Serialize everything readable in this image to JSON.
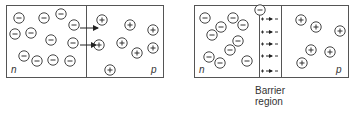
{
  "diagrams": [
    {
      "name": "before-junction",
      "frame": {
        "x": 6,
        "y": 5,
        "w": 157,
        "h": 72
      },
      "divider_x": 86,
      "n_label": "n",
      "p_label": "p",
      "electrons": [
        [
          19,
          18
        ],
        [
          44,
          18
        ],
        [
          61,
          14
        ],
        [
          74,
          25
        ],
        [
          15,
          34
        ],
        [
          31,
          33
        ],
        [
          51,
          40
        ],
        [
          73,
          43
        ],
        [
          24,
          56
        ],
        [
          37,
          61
        ],
        [
          53,
          60
        ],
        [
          70,
          61
        ]
      ],
      "holes": [
        [
          102,
          20
        ],
        [
          130,
          25
        ],
        [
          153,
          30
        ],
        [
          99,
          45
        ],
        [
          122,
          43
        ],
        [
          137,
          53
        ],
        [
          153,
          48
        ],
        [
          110,
          70
        ]
      ],
      "arrows": [
        [
          80,
          28,
          98,
          28
        ],
        [
          80,
          45,
          96,
          45
        ]
      ]
    },
    {
      "name": "after-junction",
      "frame": {
        "x": 194,
        "y": 5,
        "w": 154,
        "h": 72
      },
      "barrier": {
        "x1": 259,
        "x2": 281
      },
      "n_label": "n",
      "p_label": "p",
      "electrons": [
        [
          205,
          18
        ],
        [
          221,
          27
        ],
        [
          233,
          18
        ],
        [
          243,
          25
        ],
        [
          212,
          35
        ],
        [
          238,
          41
        ],
        [
          209,
          57
        ],
        [
          220,
          63
        ],
        [
          230,
          50
        ],
        [
          247,
          61
        ],
        [
          260,
          10
        ]
      ],
      "holes": [
        [
          301,
          20
        ],
        [
          316,
          27
        ],
        [
          340,
          31
        ],
        [
          311,
          50
        ],
        [
          330,
          52
        ],
        [
          302,
          63
        ]
      ],
      "barrier_rows": [
        19,
        32,
        44,
        56,
        71
      ],
      "caption_line1": "Barrier",
      "caption_line2": "region"
    }
  ],
  "symbols": {
    "electron": "−",
    "hole": "+",
    "barrier_row": "+ ▸ -"
  }
}
